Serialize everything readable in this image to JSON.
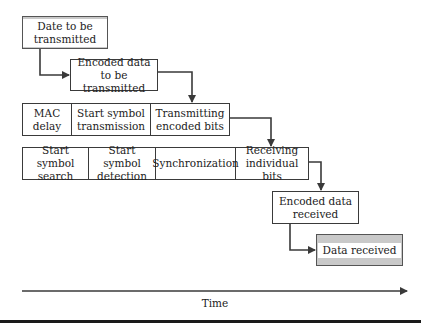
{
  "diagram": {
    "nodes": {
      "start": "Date to be transmitted",
      "encoded_tx": "Encoded data to be transmitted",
      "encoded_rx": "Encoded data received",
      "end": "Data received"
    },
    "tx_row": [
      {
        "label": "MAC delay"
      },
      {
        "label": "Start symbol transmission"
      },
      {
        "label": "Transmitting encoded bits"
      }
    ],
    "rx_row": [
      {
        "label": "Start symbol search"
      },
      {
        "label": "Start symbol detection"
      },
      {
        "label": "Synchronization"
      },
      {
        "label": "Receiving individual bits"
      }
    ],
    "axis": {
      "label": "Time"
    },
    "colors": {
      "terminal_fill": "#c9c9c9",
      "line": "#3a3a3a"
    }
  }
}
